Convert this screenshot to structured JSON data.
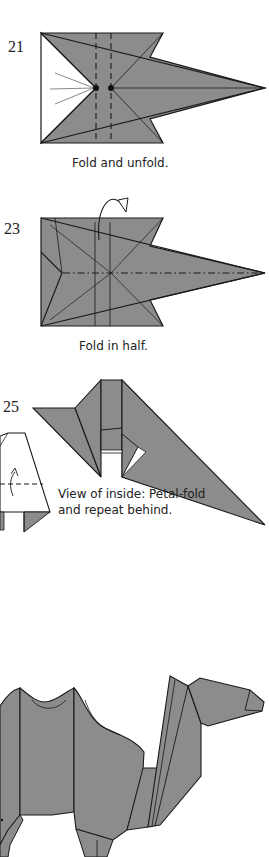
{
  "page": {
    "type": "origami-diagram",
    "colors": {
      "paper": "#8c8c8c",
      "line": "#1a1a1a",
      "background": "#ffffff",
      "white_side": "#ffffff"
    }
  },
  "steps": [
    {
      "number": "21",
      "caption": "Fold and unfold.",
      "symbols": [
        "valley-fold-dashed-lines",
        "reference-dots",
        "radiating-lines"
      ]
    },
    {
      "number": "23",
      "caption": "Fold in half.",
      "symbols": [
        "mountain-fold-dash-dot-line",
        "fold-behind-arrow"
      ]
    },
    {
      "number": "25",
      "caption_line1": "View of inside: Petal-fold",
      "caption_line2": "and repeat behind.",
      "symbols": [
        "petal-fold-arrow",
        "valley-fold-dashed-line"
      ]
    }
  ],
  "final": {
    "label": "camel-model"
  }
}
